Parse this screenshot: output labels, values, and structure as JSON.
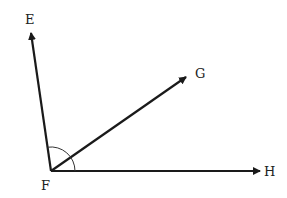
{
  "diagram": {
    "type": "geometry-angles",
    "vertex": {
      "label": "F",
      "x": 51,
      "y": 171
    },
    "rays": [
      {
        "id": "FE",
        "label": "E",
        "tip": {
          "x": 31,
          "y": 31
        },
        "label_pos": {
          "x": 24,
          "y": 24
        }
      },
      {
        "id": "FG",
        "label": "G",
        "tip": {
          "x": 188,
          "y": 76
        },
        "label_pos": {
          "x": 195,
          "y": 76
        }
      },
      {
        "id": "FH",
        "label": "H",
        "tip": {
          "x": 262,
          "y": 171
        },
        "label_pos": {
          "x": 264,
          "y": 176
        }
      }
    ],
    "angle_mark": {
      "between": [
        "FE",
        "FH"
      ],
      "radius": 24
    },
    "colors": {
      "line": "#1a1a1a",
      "text": "#222222",
      "background": "#ffffff"
    }
  },
  "labels": {
    "E": "E",
    "F": "F",
    "G": "G",
    "H": "H"
  }
}
